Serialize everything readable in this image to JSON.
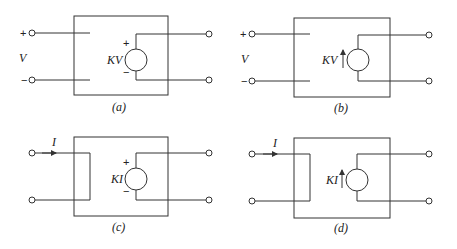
{
  "panels": {
    "a": {
      "caption": "(a)",
      "type": "voltage-controlled voltage source",
      "input_label": "V",
      "input_plus": "+",
      "input_minus": "−",
      "source_label": "KV",
      "source_plus": "+",
      "source_minus": "−"
    },
    "b": {
      "caption": "(b)",
      "type": "voltage-controlled current source",
      "input_label": "V",
      "input_plus": "+",
      "input_minus": "−",
      "source_label": "KV"
    },
    "c": {
      "caption": "(c)",
      "type": "current-controlled voltage source",
      "input_label": "I",
      "source_label": "KI",
      "source_plus": "+",
      "source_minus": "−"
    },
    "d": {
      "caption": "(d)",
      "type": "current-controlled current source",
      "input_label": "I",
      "source_label": "KI"
    }
  }
}
